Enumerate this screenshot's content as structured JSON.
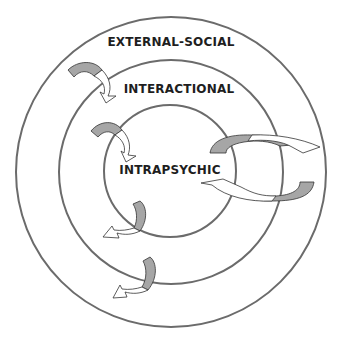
{
  "diagram": {
    "type": "concentric-circles",
    "levels": [
      {
        "id": "outer",
        "label": "EXTERNAL-SOCIAL",
        "cx": 171,
        "cy": 172,
        "r": 155
      },
      {
        "id": "middle",
        "label": "INTERACTIONAL",
        "cx": 171,
        "cy": 172,
        "r": 112
      },
      {
        "id": "inner",
        "label": "INTRAPSYCHIC",
        "cx": 170,
        "cy": 171,
        "r": 66
      }
    ],
    "arrows": [
      {
        "id": "outer-to-middle",
        "direction": "inward",
        "from": "EXTERNAL-SOCIAL",
        "to": "INTERACTIONAL"
      },
      {
        "id": "middle-to-inner",
        "direction": "inward",
        "from": "INTERACTIONAL",
        "to": "INTRAPSYCHIC"
      },
      {
        "id": "inner-to-middle",
        "direction": "outward",
        "from": "INTRAPSYCHIC",
        "to": "INTERACTIONAL"
      },
      {
        "id": "middle-to-outer",
        "direction": "outward",
        "from": "INTERACTIONAL",
        "to": "EXTERNAL-SOCIAL"
      },
      {
        "id": "cycle-right",
        "direction": "bidirectional",
        "from": "INTRAPSYCHIC",
        "to": "EXTERNAL-SOCIAL"
      }
    ],
    "colors": {
      "ring": "#6b6b6b",
      "arrow_shade": "#a6a6a6",
      "arrow_outline": "#333333",
      "text": "#1e1e1e"
    }
  }
}
